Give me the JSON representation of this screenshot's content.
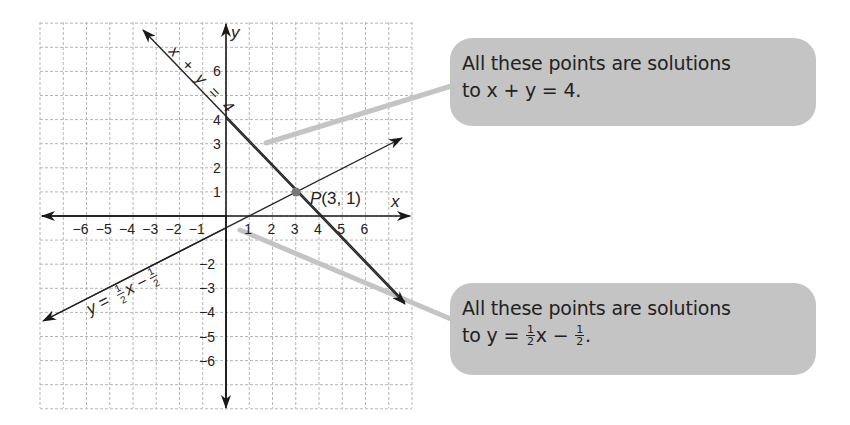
{
  "chart_data": {
    "type": "line",
    "title": "",
    "xlabel": "x",
    "ylabel": "y",
    "xlim": [
      -8,
      8
    ],
    "ylim": [
      -8,
      8
    ],
    "grid": true,
    "x_ticks": [
      "−6",
      "−5",
      "−4",
      "−3",
      "−2",
      "−1",
      "1",
      "2",
      "3",
      "4",
      "5",
      "6"
    ],
    "y_ticks": [
      "6",
      "4",
      "3",
      "2",
      "1",
      "−2",
      "−3",
      "−4",
      "−5",
      "−6"
    ],
    "series": [
      {
        "name": "x + y = 4",
        "equation": "y = -x + 4",
        "slope": -1,
        "intercept": 4,
        "points": [
          [
            -3.6,
            7.6
          ],
          [
            7.6,
            -3.6
          ]
        ]
      },
      {
        "name": "y = ½x − ½",
        "equation": "y = 0.5x - 0.5",
        "slope": 0.5,
        "intercept": -0.5,
        "points": [
          [
            -7.8,
            -4.4
          ],
          [
            7.5,
            3.2
          ]
        ]
      }
    ],
    "annotations": [
      {
        "label": "P(3, 1)",
        "x": 3,
        "y": 1,
        "type": "intersection-point"
      }
    ]
  },
  "graph": {
    "axis_x_label": "x",
    "axis_y_label": "y",
    "line1_label": "x + y = 4",
    "line2_label": "y = ½x − ½",
    "point_label": "P(3, 1)",
    "point_color": "#777777",
    "line_color": "#222222",
    "grid_color": "#b0b0b0",
    "pointer_color": "#c4c4c4"
  },
  "callouts": [
    {
      "line1": "All these points are solutions",
      "line2_prefix": "to x + y = 4."
    },
    {
      "line1": "All these points are solutions",
      "line2_prefix": "to y = ",
      "frac1_num": "1",
      "frac1_den": "2",
      "mid": "x − ",
      "frac2_num": "1",
      "frac2_den": "2",
      "suffix": "."
    }
  ]
}
